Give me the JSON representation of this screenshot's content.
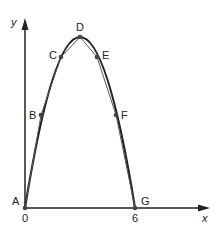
{
  "diagram": {
    "axes": {
      "x_label": "x",
      "y_label": "y",
      "ticks": [
        {
          "label": "0",
          "value": 0
        },
        {
          "label": "6",
          "value": 6
        }
      ]
    },
    "points": [
      {
        "label": "A",
        "x": 25,
        "y": 208
      },
      {
        "label": "B",
        "x": 41,
        "y": 115
      },
      {
        "label": "C",
        "x": 61,
        "y": 57
      },
      {
        "label": "D",
        "x": 80,
        "y": 37
      },
      {
        "label": "E",
        "x": 97,
        "y": 57
      },
      {
        "label": "F",
        "x": 116,
        "y": 115
      },
      {
        "label": "G",
        "x": 135,
        "y": 208
      }
    ],
    "colors": {
      "stroke": "#222222",
      "point": "#444444"
    }
  }
}
